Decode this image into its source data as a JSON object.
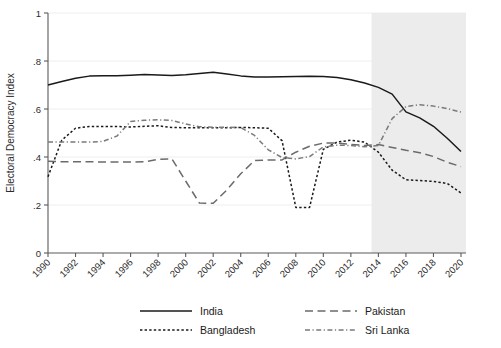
{
  "figure": {
    "background_color": "#ffffff",
    "shaded_region_color": "#e9e9e9",
    "axis_color": "#5a5a5a"
  },
  "chart_data": {
    "type": "line",
    "title": "",
    "subtitle": "",
    "xlabel": "",
    "ylabel": "Electoral Democracy Index",
    "xlim": [
      1990,
      2020
    ],
    "ylim": [
      0,
      1
    ],
    "grid": true,
    "legend_position": "bottom",
    "x_tick_labels": [
      "1990",
      "1992",
      "1994",
      "1996",
      "1998",
      "2000",
      "2002",
      "2004",
      "2006",
      "2008",
      "2010",
      "2012",
      "2014",
      "2016",
      "2018",
      "2020"
    ],
    "x_ticks": [
      1990,
      1992,
      1994,
      1996,
      1998,
      2000,
      2002,
      2004,
      2006,
      2008,
      2010,
      2012,
      2014,
      2016,
      2018,
      2020
    ],
    "y_tick_labels": [
      "0",
      ".2",
      ".4",
      ".6",
      ".8",
      "1"
    ],
    "y_ticks": [
      0,
      0.2,
      0.4,
      0.6,
      0.8,
      1
    ],
    "annotations": [
      {
        "type": "shaded-band",
        "name": "recent-period-shading",
        "x_start": 2013.5,
        "x_end": 2020.6,
        "color": "#e9e9e9"
      }
    ],
    "x": [
      1990,
      1991,
      1992,
      1993,
      1994,
      1995,
      1996,
      1997,
      1998,
      1999,
      2000,
      2001,
      2002,
      2003,
      2004,
      2005,
      2006,
      2007,
      2008,
      2009,
      2010,
      2011,
      2012,
      2013,
      2014,
      2015,
      2016,
      2017,
      2018,
      2019,
      2020
    ],
    "series": [
      {
        "name": "India",
        "style": "solid",
        "color": "#1a1a1a",
        "values": [
          0.7,
          0.715,
          0.728,
          0.737,
          0.739,
          0.739,
          0.741,
          0.744,
          0.742,
          0.74,
          0.743,
          0.748,
          0.753,
          0.746,
          0.738,
          0.733,
          0.733,
          0.734,
          0.735,
          0.736,
          0.735,
          0.731,
          0.722,
          0.708,
          0.69,
          0.662,
          0.588,
          0.563,
          0.528,
          0.478,
          0.423
        ]
      },
      {
        "name": "Bangladesh",
        "style": "dotted",
        "color": "#1a1a1a",
        "values": [
          0.318,
          0.47,
          0.52,
          0.527,
          0.527,
          0.527,
          0.525,
          0.528,
          0.53,
          0.523,
          0.522,
          0.522,
          0.522,
          0.522,
          0.523,
          0.522,
          0.52,
          0.468,
          0.19,
          0.19,
          0.432,
          0.462,
          0.47,
          0.462,
          0.42,
          0.345,
          0.305,
          0.302,
          0.298,
          0.29,
          0.25
        ]
      },
      {
        "name": "Pakistan",
        "style": "dashed-long",
        "color": "#6b6b6b",
        "values": [
          0.382,
          0.38,
          0.38,
          0.38,
          0.379,
          0.379,
          0.379,
          0.38,
          0.39,
          0.392,
          0.3,
          0.208,
          0.207,
          0.263,
          0.33,
          0.385,
          0.388,
          0.388,
          0.42,
          0.445,
          0.458,
          0.458,
          0.452,
          0.448,
          0.452,
          0.44,
          0.428,
          0.418,
          0.402,
          0.378,
          0.36
        ]
      },
      {
        "name": "Sri Lanka",
        "style": "dash-dot",
        "color": "#7a7a7a",
        "values": [
          0.462,
          0.462,
          0.463,
          0.462,
          0.465,
          0.487,
          0.548,
          0.553,
          0.555,
          0.552,
          0.538,
          0.526,
          0.524,
          0.524,
          0.523,
          0.49,
          0.43,
          0.398,
          0.392,
          0.402,
          0.442,
          0.449,
          0.448,
          0.443,
          0.448,
          0.56,
          0.61,
          0.618,
          0.612,
          0.602,
          0.587
        ]
      }
    ]
  },
  "legend": {
    "entries": [
      {
        "label": "India",
        "style": "solid"
      },
      {
        "label": "Pakistan",
        "style": "dashed-long"
      },
      {
        "label": "Bangladesh",
        "style": "dotted"
      },
      {
        "label": "Sri Lanka",
        "style": "dash-dot"
      }
    ]
  }
}
